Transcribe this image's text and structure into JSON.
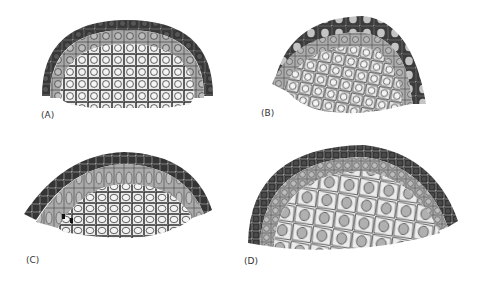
{
  "figure": {
    "panels": [
      {
        "id": "A",
        "label": "(A)",
        "description": "Dome-shaped tissue section: dark outer cell layer, gray middle layer, light inner cells with round nuclei"
      },
      {
        "id": "B",
        "label": "(B)",
        "description": "Dome-shaped tissue section with dark outer layer containing light nuclei, gray intermediate layer, light inner cells"
      },
      {
        "id": "C",
        "label": "(C)",
        "description": "Flattened dome section with dark outer layer, gray elongated-cell layer, light inner cells"
      },
      {
        "id": "D",
        "label": "(D)",
        "description": "Large dome section with dark outer layer, thin gray layer, large light inner cells with gray nuclei"
      }
    ],
    "colors": {
      "outer_layer": "#3a3a3a",
      "middle_layer": "#a8a8a8",
      "inner_region": "#ececec",
      "cell_outline": "#222222",
      "nucleus_gray": "#b0b0b0"
    }
  }
}
